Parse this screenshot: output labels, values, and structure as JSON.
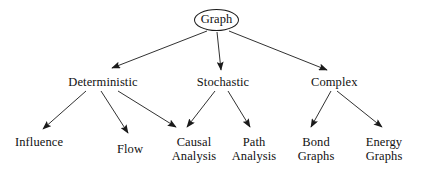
{
  "diagram": {
    "type": "tree",
    "background_color": "#ffffff",
    "line_color": "#1a1a1a",
    "text_color": "#111111",
    "root": {
      "id": "graph",
      "label": "Graph",
      "shape": "ellipse"
    },
    "level2": [
      {
        "id": "deterministic",
        "label": "Deterministic"
      },
      {
        "id": "stochastic",
        "label": "Stochastic"
      },
      {
        "id": "complex",
        "label": "Complex"
      }
    ],
    "leaves": [
      {
        "id": "influence",
        "label": "Influence"
      },
      {
        "id": "flow",
        "label": "Flow"
      },
      {
        "id": "causal-analysis",
        "label": "Causal\nAnalysis"
      },
      {
        "id": "path-analysis",
        "label": "Path\nAnalysis"
      },
      {
        "id": "bond-graphs",
        "label": "Bond\nGraphs"
      },
      {
        "id": "energy-graphs",
        "label": "Energy\nGraphs"
      }
    ],
    "edges": [
      {
        "from": "graph",
        "to": "deterministic"
      },
      {
        "from": "graph",
        "to": "stochastic"
      },
      {
        "from": "graph",
        "to": "complex"
      },
      {
        "from": "deterministic",
        "to": "influence"
      },
      {
        "from": "deterministic",
        "to": "flow"
      },
      {
        "from": "deterministic",
        "to": "causal-analysis"
      },
      {
        "from": "stochastic",
        "to": "causal-analysis"
      },
      {
        "from": "stochastic",
        "to": "path-analysis"
      },
      {
        "from": "complex",
        "to": "bond-graphs"
      },
      {
        "from": "complex",
        "to": "energy-graphs"
      }
    ]
  }
}
